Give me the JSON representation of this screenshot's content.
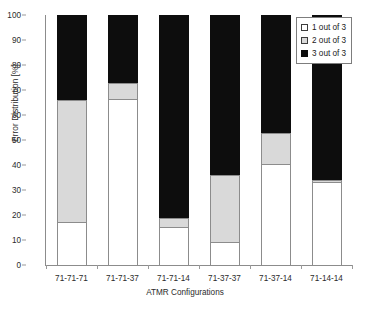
{
  "chart_data": {
    "type": "bar",
    "variant": "stacked-100-percent",
    "title": "",
    "xlabel": "ATMR Configurations",
    "ylabel": "Error Distribution [%]",
    "ylim": [
      0,
      100
    ],
    "ytick_step": 10,
    "yticks": [
      0,
      10,
      20,
      30,
      40,
      50,
      60,
      70,
      80,
      90,
      100
    ],
    "ytick_labels": [
      "0",
      "10",
      "20",
      "30",
      "40",
      "50",
      "60",
      "70",
      "80",
      "90",
      "100"
    ],
    "grid": false,
    "legend_position": "top-right",
    "categories": [
      "71-71-71",
      "71-71-37",
      "71-71-14",
      "71-37-37",
      "71-37-14",
      "71-14-14"
    ],
    "series": [
      {
        "name": "1 out of 3",
        "color": "#ffffff",
        "values": [
          17,
          66,
          15,
          9,
          40,
          33
        ]
      },
      {
        "name": "2 out of 3",
        "color": "#d9d9d9",
        "values": [
          49,
          7,
          4,
          27,
          13,
          1
        ]
      },
      {
        "name": "3 out of 3",
        "color": "#0d0d0d",
        "values": [
          34,
          27,
          81,
          64,
          47,
          66
        ]
      }
    ],
    "cumulative_tops": {
      "1 out of 3": [
        17,
        66,
        15,
        9,
        40,
        33
      ],
      "2 out of 3": [
        66,
        73,
        19,
        36,
        53,
        34
      ],
      "3 out of 3": [
        100,
        100,
        100,
        100,
        100,
        100
      ]
    }
  },
  "legend": {
    "items": [
      {
        "label": "1 out of 3",
        "swatch": "white-square-icon"
      },
      {
        "label": "2 out of 3",
        "swatch": "gray-square-icon"
      },
      {
        "label": "3 out of 3",
        "swatch": "black-square-icon"
      }
    ]
  },
  "colors": {
    "series_white": "#ffffff",
    "series_gray": "#d9d9d9",
    "series_black": "#0d0d0d",
    "axis": "#8c8c8c",
    "text": "#2b2b2b",
    "background": "#ffffff"
  }
}
